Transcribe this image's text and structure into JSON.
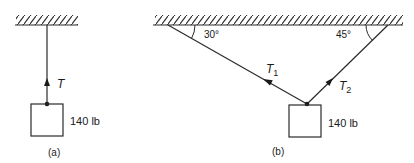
{
  "figure_a": {
    "caption": "(a)",
    "tension_label": "T",
    "weight_label": "140 lb"
  },
  "figure_b": {
    "caption": "(b)",
    "angle_left": "30°",
    "angle_right": "45°",
    "tension_1_base": "T",
    "tension_1_sub": "1",
    "tension_2_base": "T",
    "tension_2_sub": "2",
    "weight_label": "140 lb"
  },
  "colors": {
    "line": "#2a2a2a",
    "background": "#ffffff"
  }
}
